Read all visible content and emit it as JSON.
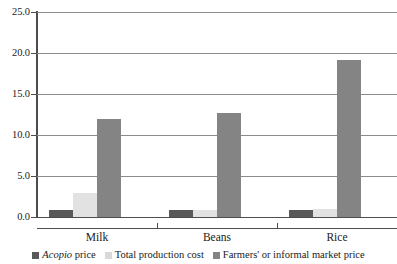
{
  "chart_data": {
    "type": "bar",
    "title": "",
    "subtitle": "",
    "xlabel": "",
    "ylabel": "",
    "categories": [
      "Milk",
      "Beans",
      "Rice"
    ],
    "series": [
      {
        "name": "Acopio price",
        "name_italic_prefix": "Acopio",
        "name_rest": " price",
        "color": "#595959",
        "values": [
          0.9,
          0.85,
          0.8
        ]
      },
      {
        "name": "Total production cost",
        "name_italic_prefix": "",
        "name_rest": "Total production cost",
        "color": "#e2e2e2",
        "values": [
          2.9,
          0.85,
          0.95
        ]
      },
      {
        "name": "Farmers' or informal market price",
        "name_italic_prefix": "",
        "name_rest": "Farmers' or informal market price",
        "color": "#848484",
        "values": [
          12.0,
          12.7,
          19.2
        ]
      }
    ],
    "ylim": [
      0.0,
      25.0
    ],
    "yticks": [
      0.0,
      5.0,
      10.0,
      15.0,
      20.0,
      25.0
    ],
    "ytick_labels": [
      "0.0",
      "5.0",
      "10.0",
      "15.0",
      "20.0",
      "25.0"
    ],
    "grid": true,
    "grid_axis": "y",
    "legend_position": "bottom",
    "background_color": "#ffffff",
    "axis_color": "#4d4d4d",
    "grid_color": "#8c8c8c"
  },
  "legend": {
    "items": [
      {
        "label": "Acopio price",
        "italic_part": "Acopio",
        "plain_part": " price"
      },
      {
        "label": "Total production cost",
        "italic_part": "",
        "plain_part": "Total production cost"
      },
      {
        "label": "Farmers' or informal market price",
        "italic_part": "",
        "plain_part": "Farmers' or informal market price"
      }
    ]
  }
}
